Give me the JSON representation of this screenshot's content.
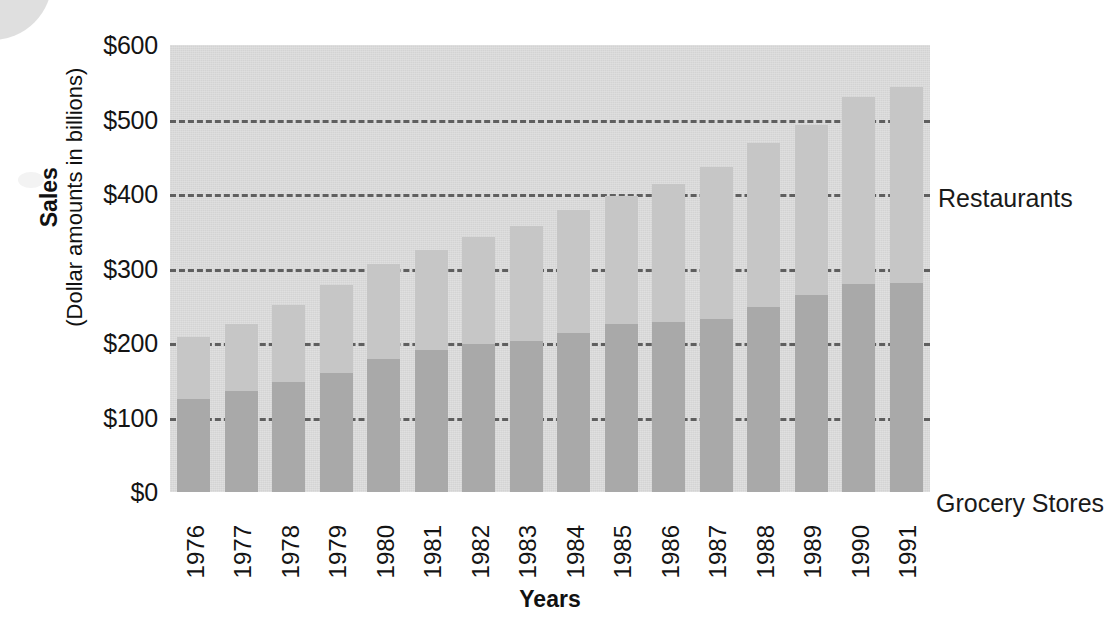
{
  "chart_data": {
    "type": "bar",
    "subtype": "stacked-bar",
    "title": "",
    "xlabel": "Years",
    "ylabel": "Sales",
    "ylabel_sub": "(Dollar amounts in billions)",
    "ylim": [
      0,
      600
    ],
    "ytick_step": 100,
    "grid": true,
    "gridlines_at": [
      100,
      200,
      300,
      400,
      500
    ],
    "legend_position": "in-plot-annotations",
    "categories": [
      "1976",
      "1977",
      "1978",
      "1979",
      "1980",
      "1981",
      "1982",
      "1983",
      "1984",
      "1985",
      "1986",
      "1987",
      "1988",
      "1989",
      "1990",
      "1991"
    ],
    "ytick_labels": [
      "$600",
      "$500",
      "$400",
      "$300",
      "$200",
      "$100",
      "$0"
    ],
    "ytick_values": [
      600,
      500,
      400,
      300,
      200,
      100,
      0
    ],
    "series": [
      {
        "name": "Grocery Stores",
        "color": "#a9a9a9",
        "values": [
          125,
          136,
          148,
          160,
          178,
          191,
          199,
          203,
          213,
          225,
          228,
          232,
          249,
          265,
          279,
          280
        ]
      },
      {
        "name": "Restaurants",
        "color": "#c6c6c6",
        "values": [
          83,
          89,
          103,
          118,
          128,
          134,
          143,
          154,
          165,
          173,
          185,
          204,
          220,
          227,
          251,
          263
        ]
      }
    ],
    "totals": [
      208,
      225,
      251,
      278,
      306,
      325,
      342,
      357,
      378,
      398,
      413,
      436,
      469,
      492,
      530,
      543
    ],
    "annotations": [
      {
        "label": "Restaurants",
        "series": "Restaurants"
      },
      {
        "label": "Grocery Stores",
        "series": "Grocery Stores"
      }
    ],
    "colors": {
      "plot_background": "#dcdcdc",
      "grocery": "#a9a9a9",
      "restaurants": "#c6c6c6",
      "gridline": "#4a4a4a",
      "text": "#141414"
    }
  }
}
